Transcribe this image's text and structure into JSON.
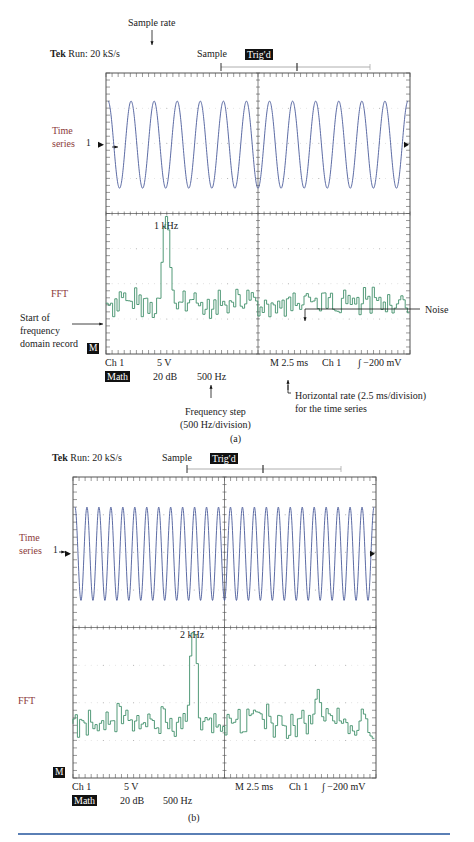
{
  "figure_a": {
    "annotation_sample_rate": "Sample rate",
    "header_brand": "Tek",
    "header_run": "Run: 20 kS/s",
    "header_mode": "Sample",
    "header_trig": "Trig'd",
    "label_time_series_1": "Time",
    "label_time_series_2": "series",
    "channel_marker": "1",
    "label_fft": "FFT",
    "annotation_start_1": "Start of",
    "annotation_start_2": "frequency",
    "annotation_start_3": "domain record",
    "annotation_noise": "Noise",
    "peak_label": "1 kHz",
    "math_marker": "M",
    "readout_ch": "Ch 1",
    "readout_volts": "5 V",
    "readout_math": "Math",
    "readout_db": "20 dB",
    "readout_hz": "500 Hz",
    "readout_time": "M 2.5 ms",
    "readout_trig_ch": "Ch 1",
    "readout_trig_level": "∫ −200 mV",
    "annotation_freq_step_1": "Frequency step",
    "annotation_freq_step_2": "(500 Hz/division)",
    "annotation_horiz_1": "Horizontal rate (2.5 ms/division)",
    "annotation_horiz_2": "for the time series",
    "caption": "(a)"
  },
  "figure_b": {
    "header_brand": "Tek",
    "header_run": "Run: 20 kS/s",
    "header_mode": "Sample",
    "header_trig": "Trig'd",
    "label_time_series_1": "Time",
    "label_time_series_2": "series",
    "channel_marker": "1",
    "label_fft": "FFT",
    "peak_label": "2 kHz",
    "math_marker": "M",
    "readout_ch": "Ch 1",
    "readout_volts": "5 V",
    "readout_math": "Math",
    "readout_db": "20 dB",
    "readout_hz": "500 Hz",
    "readout_time": "M 2.5 ms",
    "readout_trig_ch": "Ch 1",
    "readout_trig_level": "∫ −200 mV",
    "caption": "(b)"
  },
  "colors": {
    "time_trace": "#4a5a9a",
    "fft_trace": "#3f8f6a",
    "label_red": "#8b3a3a",
    "rule": "#5a7fb5"
  },
  "chart_data": [
    {
      "type": "line",
      "title": "Tek Run: 20 kS/s — (a) 1 kHz signal",
      "panels": [
        {
          "name": "Time series",
          "signal_frequency_hz": 1000,
          "horizontal_scale": "2.5 ms/division",
          "vertical_scale": "5 V",
          "cycles_visible": 25
        },
        {
          "name": "FFT",
          "peak_frequency_hz": 1000,
          "peak_label": "1 kHz",
          "frequency_step": "500 Hz/division",
          "vertical_scale": "20 dB",
          "noise_floor": "low, random"
        }
      ],
      "annotations": [
        "Sample rate",
        "Start of frequency domain record",
        "Noise",
        "Frequency step (500 Hz/division)",
        "Horizontal rate (2.5 ms/division) for the time series"
      ],
      "trigger": "Ch 1 −200 mV"
    },
    {
      "type": "line",
      "title": "Tek Run: 20 kS/s — (b) 2 kHz signal",
      "panels": [
        {
          "name": "Time series",
          "signal_frequency_hz": 2000,
          "horizontal_scale": "2.5 ms/division",
          "vertical_scale": "5 V",
          "cycles_visible": 50
        },
        {
          "name": "FFT",
          "peak_frequency_hz": 2000,
          "peak_label": "2 kHz",
          "frequency_step": "500 Hz/division",
          "vertical_scale": "20 dB",
          "secondary_peak_hz": 6000
        }
      ],
      "trigger": "Ch 1 −200 mV"
    }
  ]
}
